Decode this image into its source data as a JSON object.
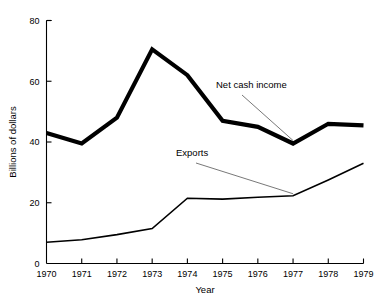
{
  "chart_data": {
    "type": "line",
    "title": "",
    "xlabel": "Year",
    "ylabel": "Billions of dollars",
    "x": [
      1970,
      1971,
      1972,
      1973,
      1974,
      1975,
      1976,
      1977,
      1978,
      1979
    ],
    "categories": [
      "1970",
      "1971",
      "1972",
      "1973",
      "1974",
      "1975",
      "1976",
      "1977",
      "1978",
      "1979"
    ],
    "xlim": [
      1970,
      1979
    ],
    "ylim": [
      0,
      80
    ],
    "yticks": [
      0,
      20,
      40,
      60,
      80
    ],
    "ytick_labels": [
      "0",
      "20",
      "40",
      "60",
      "80"
    ],
    "xticks": [
      1970,
      1971,
      1972,
      1973,
      1974,
      1975,
      1976,
      1977,
      1978,
      1979
    ],
    "grid": false,
    "legend": "annotations",
    "series": [
      {
        "name": "Net cash income",
        "style": "thick-line",
        "values": [
          43,
          39.5,
          48,
          70.5,
          62,
          47,
          45,
          39.5,
          46,
          45.5
        ]
      },
      {
        "name": "Exports",
        "style": "thin-line",
        "values": [
          7,
          7.8,
          9.5,
          11.5,
          21.5,
          21.2,
          21.8,
          22.3,
          27.5,
          33
        ]
      }
    ],
    "annotations": [
      {
        "text": "Net cash income",
        "target_series": "Net cash income",
        "target_year": 1977,
        "target_value": 39.5
      },
      {
        "text": "Exports",
        "target_series": "Exports",
        "target_year": 1977,
        "target_value": 22.3
      }
    ]
  }
}
